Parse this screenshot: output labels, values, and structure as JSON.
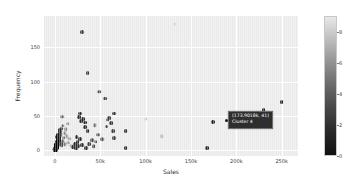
{
  "chart_data": {
    "type": "scatter",
    "title": "",
    "xlabel": "Sales",
    "ylabel": "Frequency",
    "xlim": [
      -12000,
      268000
    ],
    "ylim": [
      -9,
      196
    ],
    "grid": true,
    "xticks": [
      {
        "value": 0,
        "label": "0"
      },
      {
        "value": 50000,
        "label": "50k"
      },
      {
        "value": 100000,
        "label": "100k"
      },
      {
        "value": 150000,
        "label": "150k"
      },
      {
        "value": 200000,
        "label": "200k"
      },
      {
        "value": 250000,
        "label": "250k"
      }
    ],
    "yticks": [
      {
        "value": 0,
        "label": "0"
      },
      {
        "value": 50,
        "label": "50"
      },
      {
        "value": 100,
        "label": "100"
      },
      {
        "value": 150,
        "label": "150"
      }
    ],
    "colorbar": {
      "label": "",
      "position": "right",
      "colormap": "grayscale",
      "vmin": 0,
      "vmax": 9,
      "ticks": [
        {
          "value": 0,
          "label": "0"
        },
        {
          "value": 2,
          "label": "2"
        },
        {
          "value": 4,
          "label": "4"
        },
        {
          "value": 6,
          "label": "6"
        },
        {
          "value": 8,
          "label": "8"
        }
      ]
    },
    "points": [
      {
        "x": 132000,
        "y": 185,
        "c": "#cfcfcf",
        "r": 1.6
      },
      {
        "x": 30000,
        "y": 172,
        "c": "#3a3a3a",
        "r": 1.9
      },
      {
        "x": 36000,
        "y": 112,
        "c": "#3a3a3a",
        "r": 1.9
      },
      {
        "x": 49000,
        "y": 85,
        "c": "#555555",
        "r": 1.8
      },
      {
        "x": 55000,
        "y": 75,
        "c": "#3f3f3f",
        "r": 1.9
      },
      {
        "x": 250000,
        "y": 70,
        "c": "#262626",
        "r": 1.9
      },
      {
        "x": 230000,
        "y": 58,
        "c": "#262626",
        "r": 1.9
      },
      {
        "x": 65000,
        "y": 53,
        "c": "#2e2e2e",
        "r": 1.9
      },
      {
        "x": 28000,
        "y": 53,
        "c": "#2e2e2e",
        "r": 1.9
      },
      {
        "x": 60000,
        "y": 47,
        "c": "#3a3a3a",
        "r": 1.9
      },
      {
        "x": 58000,
        "y": 44,
        "c": "#444444",
        "r": 1.8
      },
      {
        "x": 31000,
        "y": 45,
        "c": "#2a2a2a",
        "r": 1.9
      },
      {
        "x": 8000,
        "y": 48,
        "c": "#6a6a6a",
        "r": 1.7
      },
      {
        "x": 33000,
        "y": 40,
        "c": "#2a2a2a",
        "r": 1.9
      },
      {
        "x": 100000,
        "y": 45,
        "c": "#cccccc",
        "r": 1.6
      },
      {
        "x": 173901,
        "y": 41,
        "c": "#1a1a1a",
        "r": 2.0
      },
      {
        "x": 44000,
        "y": 36,
        "c": "#6f6f6f",
        "r": 1.7
      },
      {
        "x": 33000,
        "y": 33,
        "c": "#2a2a2a",
        "r": 1.9
      },
      {
        "x": 36000,
        "y": 27,
        "c": "#2a2a2a",
        "r": 1.9
      },
      {
        "x": 78000,
        "y": 28,
        "c": "#2a2a2a",
        "r": 1.9
      },
      {
        "x": 64000,
        "y": 27,
        "c": "#3a3a3a",
        "r": 1.9
      },
      {
        "x": 48000,
        "y": 22,
        "c": "#5a5a5a",
        "r": 1.8
      },
      {
        "x": 118000,
        "y": 20,
        "c": "#b8b8b8",
        "r": 1.7
      },
      {
        "x": 65000,
        "y": 17,
        "c": "#3a3a3a",
        "r": 1.9
      },
      {
        "x": 24000,
        "y": 19,
        "c": "#2a2a2a",
        "r": 1.9
      },
      {
        "x": 28000,
        "y": 16,
        "c": "#2a2a2a",
        "r": 1.9
      },
      {
        "x": 41000,
        "y": 14,
        "c": "#4a4a4a",
        "r": 1.8
      },
      {
        "x": 45000,
        "y": 12,
        "c": "#5a5a5a",
        "r": 1.7
      },
      {
        "x": 25000,
        "y": 11,
        "c": "#2a2a2a",
        "r": 1.9
      },
      {
        "x": 22000,
        "y": 9,
        "c": "#2a2a2a",
        "r": 1.9
      },
      {
        "x": 30000,
        "y": 7,
        "c": "#2a2a2a",
        "r": 1.9
      },
      {
        "x": 26000,
        "y": 5,
        "c": "#2a2a2a",
        "r": 1.9
      },
      {
        "x": 78000,
        "y": 2,
        "c": "#2a2a2a",
        "r": 1.9
      },
      {
        "x": 168000,
        "y": 3,
        "c": "#2a2a2a",
        "r": 1.9
      },
      {
        "x": 14000,
        "y": 38,
        "c": "#909090",
        "r": 1.7
      },
      {
        "x": 12000,
        "y": 30,
        "c": "#8a8a8a",
        "r": 1.7
      },
      {
        "x": 11000,
        "y": 24,
        "c": "#8f8f8f",
        "r": 1.7
      },
      {
        "x": 13000,
        "y": 20,
        "c": "#9a9a9a",
        "r": 1.7
      },
      {
        "x": 16000,
        "y": 16,
        "c": "#a5a5a5",
        "r": 1.7
      },
      {
        "x": 15000,
        "y": 10,
        "c": "#9f9f9f",
        "r": 1.7
      },
      {
        "x": 18000,
        "y": 6,
        "c": "#b0b0b0",
        "r": 1.7
      },
      {
        "x": 9000,
        "y": 35,
        "c": "#6a6a6a",
        "r": 1.7
      },
      {
        "x": 7000,
        "y": 31,
        "c": "#4a4a4a",
        "r": 1.8
      },
      {
        "x": 6000,
        "y": 27,
        "c": "#3a3a3a",
        "r": 1.9
      },
      {
        "x": 5500,
        "y": 24,
        "c": "#303030",
        "r": 1.9
      },
      {
        "x": 5000,
        "y": 21,
        "c": "#272727",
        "r": 2.0
      },
      {
        "x": 4600,
        "y": 19,
        "c": "#222222",
        "r": 2.0
      },
      {
        "x": 4300,
        "y": 17,
        "c": "#1e1e1e",
        "r": 2.0
      },
      {
        "x": 4000,
        "y": 15,
        "c": "#1a1a1a",
        "r": 2.1
      },
      {
        "x": 3800,
        "y": 13.5,
        "c": "#171717",
        "r": 2.1
      },
      {
        "x": 3600,
        "y": 12,
        "c": "#141414",
        "r": 2.1
      },
      {
        "x": 3400,
        "y": 11,
        "c": "#121212",
        "r": 2.1
      },
      {
        "x": 3200,
        "y": 10,
        "c": "#101010",
        "r": 2.1
      },
      {
        "x": 3000,
        "y": 9,
        "c": "#0e0e0e",
        "r": 2.2
      },
      {
        "x": 2800,
        "y": 8.2,
        "c": "#0d0d0d",
        "r": 2.2
      },
      {
        "x": 2600,
        "y": 7.4,
        "c": "#0c0c0c",
        "r": 2.2
      },
      {
        "x": 2400,
        "y": 6.6,
        "c": "#0b0b0b",
        "r": 2.2
      },
      {
        "x": 2200,
        "y": 6.0,
        "c": "#0a0a0a",
        "r": 2.2
      },
      {
        "x": 2000,
        "y": 5.4,
        "c": "#090909",
        "r": 2.2
      },
      {
        "x": 1900,
        "y": 4.8,
        "c": "#080808",
        "r": 2.2
      },
      {
        "x": 1800,
        "y": 4.3,
        "c": "#070707",
        "r": 2.2
      },
      {
        "x": 1700,
        "y": 3.8,
        "c": "#070707",
        "r": 2.2
      },
      {
        "x": 1600,
        "y": 3.4,
        "c": "#060606",
        "r": 2.2
      },
      {
        "x": 1500,
        "y": 3.0,
        "c": "#060606",
        "r": 2.2
      },
      {
        "x": 1400,
        "y": 2.6,
        "c": "#050505",
        "r": 2.2
      },
      {
        "x": 1300,
        "y": 2.3,
        "c": "#050505",
        "r": 2.2
      },
      {
        "x": 1200,
        "y": 2.0,
        "c": "#040404",
        "r": 2.2
      },
      {
        "x": 1100,
        "y": 1.7,
        "c": "#040404",
        "r": 2.2
      },
      {
        "x": 1000,
        "y": 1.4,
        "c": "#030303",
        "r": 2.2
      },
      {
        "x": 900,
        "y": 1.2,
        "c": "#030303",
        "r": 2.2
      },
      {
        "x": 800,
        "y": 1.0,
        "c": "#020202",
        "r": 2.2
      },
      {
        "x": 700,
        "y": 0.8,
        "c": "#020202",
        "r": 2.2
      },
      {
        "x": 600,
        "y": 0.6,
        "c": "#010101",
        "r": 2.2
      },
      {
        "x": 500,
        "y": 0.4,
        "c": "#010101",
        "r": 2.2
      },
      {
        "x": 400,
        "y": 0.3,
        "c": "#000000",
        "r": 2.2
      },
      {
        "x": 300,
        "y": 0.2,
        "c": "#000000",
        "r": 2.2
      },
      {
        "x": 5200,
        "y": 29,
        "c": "#2c2c2c",
        "r": 1.9
      },
      {
        "x": 6200,
        "y": 22,
        "c": "#3c3c3c",
        "r": 1.9
      },
      {
        "x": 4800,
        "y": 13,
        "c": "#1d1d1d",
        "r": 2.1
      },
      {
        "x": 6600,
        "y": 9,
        "c": "#3f3f3f",
        "r": 1.9
      },
      {
        "x": 7400,
        "y": 6,
        "c": "#4f4f4f",
        "r": 1.8
      },
      {
        "x": 8600,
        "y": 13,
        "c": "#5f5f5f",
        "r": 1.8
      },
      {
        "x": 9800,
        "y": 18,
        "c": "#6f6f6f",
        "r": 1.8
      },
      {
        "x": 10600,
        "y": 8,
        "c": "#7a7a7a",
        "r": 1.7
      },
      {
        "x": 2500,
        "y": 19,
        "c": "#0f0f0f",
        "r": 2.1
      },
      {
        "x": 2900,
        "y": 16,
        "c": "#121212",
        "r": 2.1
      },
      {
        "x": 3300,
        "y": 22,
        "c": "#161616",
        "r": 2.1
      },
      {
        "x": 1800,
        "y": 12,
        "c": "#080808",
        "r": 2.2
      },
      {
        "x": 2100,
        "y": 9,
        "c": "#0a0a0a",
        "r": 2.2
      },
      {
        "x": 1200,
        "y": 7,
        "c": "#050505",
        "r": 2.2
      },
      {
        "x": 900,
        "y": 4,
        "c": "#030303",
        "r": 2.2
      },
      {
        "x": 20000,
        "y": 4,
        "c": "#2b2b2b",
        "r": 1.9
      },
      {
        "x": 23000,
        "y": 2,
        "c": "#2b2b2b",
        "r": 1.9
      },
      {
        "x": 34000,
        "y": 3,
        "c": "#2b2b2b",
        "r": 1.9
      },
      {
        "x": 38000,
        "y": 9,
        "c": "#3b3b3b",
        "r": 1.9
      },
      {
        "x": 43000,
        "y": 5,
        "c": "#4b4b4b",
        "r": 1.8
      },
      {
        "x": 52000,
        "y": 16,
        "c": "#5b5b5b",
        "r": 1.8
      },
      {
        "x": 57000,
        "y": 34,
        "c": "#454545",
        "r": 1.9
      },
      {
        "x": 62000,
        "y": 39,
        "c": "#353535",
        "r": 1.9
      },
      {
        "x": 27000,
        "y": 48,
        "c": "#2a2a2a",
        "r": 1.9
      },
      {
        "x": 29000,
        "y": 42,
        "c": "#2a2a2a",
        "r": 1.9
      }
    ]
  },
  "tooltip": {
    "line1": "(173.9018k, 41)",
    "line2": "Cluster 4",
    "background": "#2e2e2e",
    "text_color": "#ffffff"
  },
  "style": {
    "plot_background": "#eaeaea",
    "grid_color": "#ffffff",
    "figure_background": "#ffffff",
    "tick_color": "#3a3a3a"
  }
}
